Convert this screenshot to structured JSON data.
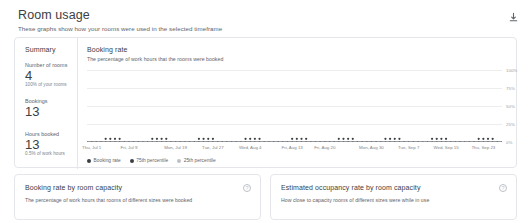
{
  "header": {
    "title": "Room usage",
    "subtitle": "These graphs show how your rooms were used in the selected timeframe",
    "download_icon": "download-icon"
  },
  "summary": {
    "title": "Summary",
    "metrics": [
      {
        "label": "Number of rooms",
        "value": "4",
        "note": "100% of your rooms"
      },
      {
        "label": "Bookings",
        "value": "13",
        "note": ""
      },
      {
        "label": "Hours booked",
        "value": "13",
        "note": "0.5% of work hours"
      }
    ]
  },
  "booking_rate_panel": {
    "title": "Booking rate",
    "subtitle": "The percentage of work hours that the rooms were booked"
  },
  "bottom_panels": [
    {
      "title": "Booking rate by room capacity",
      "subtitle": "The percentage of work hours that rooms of different sizes were booked",
      "help_icon": "help-icon",
      "help_glyph": "?"
    },
    {
      "title": "Estimated occupancy rate by room capacity",
      "subtitle": "How close to capacity rooms of different sizes were while in use",
      "help_icon": "help-icon",
      "help_glyph": "?"
    }
  ],
  "colors": {
    "booking_rate": "#3c4043",
    "p75": "#3c4043",
    "p25": "#bdc1c6",
    "grid": "#ededed",
    "axis": "#dadce0"
  },
  "chart_data": {
    "type": "line",
    "title": "Booking rate",
    "subtitle": "The percentage of work hours that the rooms were booked",
    "xlabel": "",
    "ylabel": "",
    "ylim": [
      0,
      100
    ],
    "yticks": [
      "100%",
      "75%",
      "50%",
      "25%",
      "0%"
    ],
    "ytick_values": [
      100,
      75,
      50,
      25,
      0
    ],
    "grid": true,
    "legend_position": "bottom-left",
    "xtick_labels": [
      "Thu, Jul 1",
      "Fri, Jul 9",
      "Mon, Jul 19",
      "Tue, Jul 27",
      "Wed, Aug 4",
      "Fri, Aug 13",
      "Fri, Aug 20",
      "Mon, Aug 30",
      "Tue, Sep 7",
      "Wed, Sep 15",
      "Thu, Sep 23"
    ],
    "xtick_positions": [
      1,
      9,
      19,
      27,
      35,
      44,
      51,
      61,
      69,
      77,
      85
    ],
    "x": [
      0,
      1,
      2,
      3,
      4,
      5,
      6,
      7,
      8,
      9,
      10,
      11,
      12,
      13,
      14,
      15,
      16,
      17,
      18,
      19,
      20,
      21,
      22,
      23,
      24,
      25,
      26,
      27,
      28,
      29,
      30,
      31,
      32,
      33,
      34,
      35,
      36,
      37,
      38,
      39,
      40,
      41,
      42,
      43,
      44,
      45,
      46,
      47,
      48,
      49,
      50,
      51,
      52,
      53,
      54,
      55,
      56,
      57,
      58,
      59,
      60,
      61,
      62,
      63,
      64,
      65,
      66,
      67,
      68,
      69,
      70,
      71,
      72,
      73,
      74,
      75,
      76,
      77,
      78,
      79,
      80,
      81,
      82,
      83,
      84,
      85,
      86,
      87,
      88,
      89
    ],
    "series": [
      {
        "name": "Booking rate",
        "color": "#3c4043",
        "values": [
          0,
          0,
          0,
          0,
          0,
          0,
          0,
          0,
          0,
          0,
          0,
          0,
          0,
          0,
          0,
          0,
          0,
          0,
          0,
          0,
          0,
          0,
          0,
          0,
          0,
          0,
          0,
          0,
          0,
          0,
          0,
          0,
          0,
          0,
          0,
          0,
          0,
          0,
          0,
          0,
          0,
          0,
          0,
          0,
          0,
          0,
          0,
          0,
          0,
          0,
          0,
          0,
          0,
          0,
          0,
          0,
          0,
          0,
          0,
          0,
          0,
          0,
          0,
          0,
          0,
          0,
          0,
          0,
          0,
          0,
          0,
          0,
          0,
          0,
          0,
          0,
          0,
          0,
          0,
          0,
          0,
          0,
          0,
          0,
          0,
          0,
          0,
          0,
          0,
          0
        ]
      },
      {
        "name": "75th percentile",
        "color": "#3c4043",
        "values": [
          0,
          0,
          0,
          0,
          0,
          0,
          0,
          0,
          0,
          0,
          0,
          0,
          0,
          0,
          0,
          0,
          0,
          0,
          0,
          0,
          0,
          0,
          0,
          0,
          0,
          0,
          0,
          0,
          0,
          0,
          0,
          0,
          0,
          0,
          0,
          0,
          0,
          0,
          0,
          0,
          0,
          0,
          0,
          0,
          0,
          0,
          0,
          0,
          0,
          0,
          0,
          0,
          0,
          0,
          0,
          0,
          0,
          0,
          0,
          0,
          0,
          0,
          0,
          0,
          0,
          0,
          0,
          0,
          0,
          0,
          0,
          0,
          0,
          0,
          0,
          0,
          0,
          0,
          0,
          0,
          0,
          0,
          0,
          0,
          0,
          0,
          0,
          0,
          0,
          0
        ]
      },
      {
        "name": "25th percentile",
        "color": "#bdc1c6",
        "values": [
          0,
          0,
          0,
          0,
          0,
          0,
          0,
          0,
          0,
          0,
          0,
          0,
          0,
          0,
          0,
          0,
          0,
          0,
          0,
          0,
          0,
          0,
          0,
          0,
          0,
          0,
          0,
          0,
          0,
          0,
          0,
          0,
          0,
          0,
          0,
          0,
          0,
          0,
          0,
          0,
          0,
          0,
          0,
          0,
          0,
          0,
          0,
          0,
          0,
          0,
          0,
          0,
          0,
          0,
          0,
          0,
          0,
          0,
          0,
          0,
          0,
          0,
          0,
          0,
          0,
          0,
          0,
          0,
          0,
          0,
          0,
          0,
          0,
          0,
          0,
          0,
          0,
          0,
          0,
          0,
          0,
          0,
          0,
          0,
          0,
          0,
          0,
          0,
          0,
          0
        ]
      }
    ],
    "markers": {
      "note": "Weekly cluster markers sit on the 0% baseline",
      "positions": [
        4,
        5,
        6,
        7,
        14,
        15,
        16,
        17,
        24,
        25,
        26,
        27,
        34,
        35,
        36,
        37,
        44,
        45,
        46,
        47,
        54,
        55,
        56,
        57,
        64,
        65,
        66,
        67,
        74,
        75,
        76,
        77,
        84,
        85,
        86,
        87
      ]
    },
    "legend": [
      {
        "label": "Booking rate",
        "color": "#3c4043"
      },
      {
        "label": "75th percentile",
        "color": "#3c4043"
      },
      {
        "label": "25th percentile",
        "color": "#bdc1c6"
      }
    ]
  }
}
